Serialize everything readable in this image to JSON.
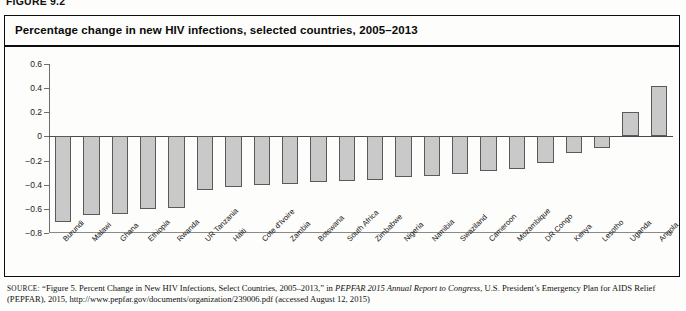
{
  "figure": {
    "label": "FIGURE 9.2",
    "title": "Percentage change in new HIV infections, selected countries, 2005–2013"
  },
  "source": {
    "prefix": "SOURCE:",
    "part1": "“Figure 5. Percent Change in New HIV Infections, Select Countries, 2005–2013,” in ",
    "italic": "PEPFAR 2015 Annual Report to Congress",
    "part2": ", U.S. President’s Emergency Plan for AIDS Relief (PEPFAR), 2015, http://www.pepfar.gov/documents/organization/239006.pdf (accessed August 12, 2015)"
  },
  "chart_data": {
    "type": "bar",
    "title": "Percentage change in new HIV infections, selected countries, 2005–2013",
    "xlabel": "",
    "ylabel": "",
    "ylim": [
      -0.8,
      0.6
    ],
    "yticks": [
      0.6,
      0.4,
      0.2,
      0,
      -0.2,
      -0.4,
      -0.6,
      -0.8
    ],
    "ytick_labels": [
      "0.6",
      "0.4",
      "0.2",
      "0",
      "−0.2",
      "−0.4",
      "−0.6",
      "−0.8"
    ],
    "grid": false,
    "legend": false,
    "bar_color": "#c9c9c9",
    "bar_edge_color": "#5a5a5a",
    "categories": [
      "Burundi",
      "Malawi",
      "Ghana",
      "Ethiopia",
      "Rwanda",
      "UR Tanzania",
      "Haiti",
      "Cote d'Ivoire",
      "Zambia",
      "Botswana",
      "South Africa",
      "Zimbabwe",
      "Nigeria",
      "Namibia",
      "Swaziland",
      "Cameroon",
      "Mozambique",
      "DR Congo",
      "Kenya",
      "Lesotho",
      "Uganda",
      "Angola"
    ],
    "values": [
      -0.71,
      -0.65,
      -0.64,
      -0.6,
      -0.59,
      -0.44,
      -0.42,
      -0.4,
      -0.39,
      -0.38,
      -0.37,
      -0.36,
      -0.34,
      -0.33,
      -0.31,
      -0.29,
      -0.27,
      -0.22,
      -0.14,
      -0.1,
      0.2,
      0.42
    ]
  }
}
